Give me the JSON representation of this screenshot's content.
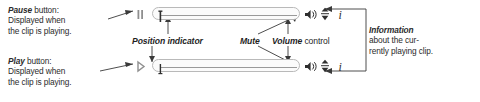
{
  "figure": {
    "kind": "annotated-media-player-toolbar-diagram",
    "rows": [
      {
        "state": "paused",
        "transport_button": "pause-button",
        "transport_glyph": "II",
        "position_indicator_value": "start"
      },
      {
        "state": "playing",
        "transport_button": "play-button",
        "transport_glyph": "▶",
        "position_indicator_value": "start"
      }
    ],
    "controls": {
      "mute": "Mute",
      "volume": "Volume",
      "information": "Information",
      "position_indicator": "Position indicator"
    }
  },
  "callouts": {
    "pause": {
      "lead": "Pause",
      "line1_rest": " button:",
      "line2": "Displayed when",
      "line3": "the clip is playing."
    },
    "play": {
      "lead": "Play",
      "line1_rest": " button:",
      "line2": "Displayed when",
      "line3": "the clip is playing."
    },
    "information": {
      "lead": "Information",
      "line2": "about the cur-",
      "line3": "rently playing clip."
    }
  },
  "labels": {
    "position_indicator": {
      "lead": "Position indicator",
      "rest": ""
    },
    "mute": {
      "lead": "Mute",
      "rest": ""
    },
    "volume": {
      "lead": "Volume",
      "rest": " control"
    }
  },
  "colors": {
    "ink": "#2b2b2b",
    "rule": "#3a3a3a",
    "track_border": "#b9b9b9",
    "track_fill": "#fbfbfb",
    "transport_glyph": "#8f8f8f",
    "control_glyph": "#2f2f2f",
    "background": "#ffffff"
  },
  "icon_names": {
    "pause": "pause-icon",
    "play": "play-icon",
    "mute": "speaker-mute-icon",
    "volume": "volume-updown-icon",
    "info": "info-i-icon",
    "position": "position-indicator-thumb-icon"
  }
}
